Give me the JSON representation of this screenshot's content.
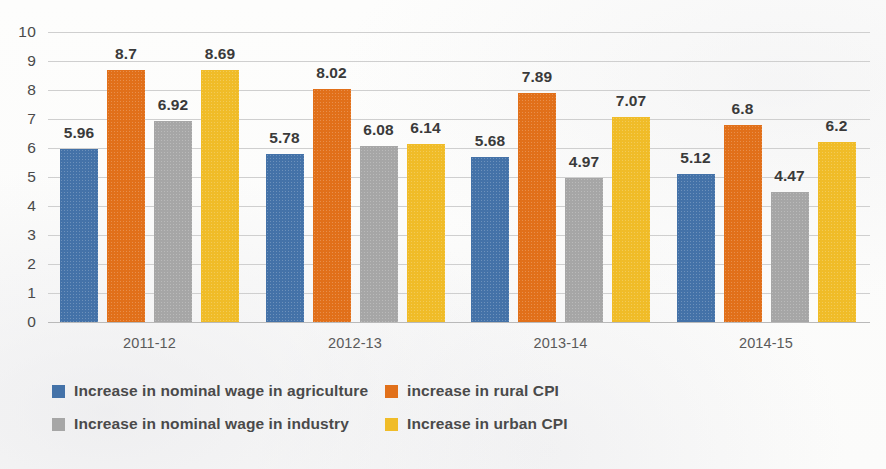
{
  "chart_data": {
    "type": "bar",
    "title": "",
    "subtitle": "",
    "xlabel": "",
    "ylabel": "",
    "ylim": [
      0,
      10
    ],
    "ystep": 1,
    "ytick_labels": [
      "10",
      "9",
      "8",
      "7",
      "6",
      "5",
      "4",
      "3",
      "2",
      "1",
      "0"
    ],
    "grid": true,
    "legend_position": "bottom",
    "categories": [
      "2011-12",
      "2012-13",
      "2013-14",
      "2014-15"
    ],
    "series": [
      {
        "name": "Increase in nominal wage in agriculture",
        "color": "#4472a8",
        "values": [
          5.96,
          5.78,
          5.68,
          5.12
        ],
        "labels": [
          "5.96",
          "5.78",
          "5.68",
          "5.12"
        ]
      },
      {
        "name": "increase in rural CPI",
        "color": "#e1701a",
        "values": [
          8.7,
          8.02,
          7.89,
          6.8
        ],
        "labels": [
          "8.7",
          "8.02",
          "7.89",
          "6.8"
        ]
      },
      {
        "name": "Increase in nominal wage in industry",
        "color": "#a6a6a6",
        "values": [
          6.92,
          6.08,
          4.97,
          4.47
        ],
        "labels": [
          "6.92",
          "6.08",
          "4.97",
          "4.47"
        ]
      },
      {
        "name": "Increase in urban CPI",
        "color": "#f0bc28",
        "values": [
          8.69,
          6.14,
          7.07,
          6.2
        ],
        "labels": [
          "8.69",
          "6.14",
          "7.07",
          "6.2"
        ]
      }
    ]
  },
  "legend": {
    "entries": [
      {
        "label": "Increase in nominal wage in agriculture",
        "color": "#4472a8",
        "row": 0,
        "col": 0
      },
      {
        "label": "increase in rural CPI",
        "color": "#e1701a",
        "row": 0,
        "col": 1
      },
      {
        "label": "Increase in nominal wage in industry",
        "color": "#a6a6a6",
        "row": 1,
        "col": 0
      },
      {
        "label": "Increase in urban CPI",
        "color": "#f0bc28",
        "row": 1,
        "col": 1
      }
    ]
  }
}
